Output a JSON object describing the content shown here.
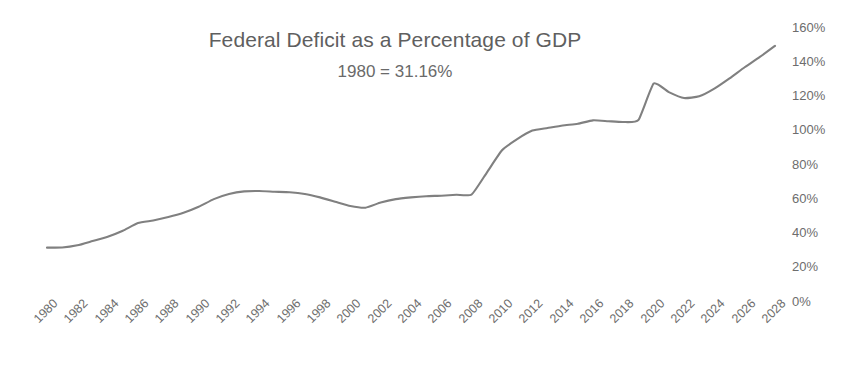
{
  "chart_data": {
    "type": "line",
    "title": "Federal Deficit as a Percentage of GDP",
    "subtitle": "1980 = 31.16%",
    "xlabel": "",
    "ylabel": "",
    "ylim": [
      0,
      160
    ],
    "xlim": [
      1980,
      2028
    ],
    "grid": false,
    "legend": null,
    "line_color": "#808080",
    "y_ticks": [
      "160%",
      "140%",
      "120%",
      "100%",
      "80%",
      "60%",
      "40%",
      "20%",
      "0%"
    ],
    "y_tick_values": [
      160,
      140,
      120,
      100,
      80,
      60,
      40,
      20,
      0
    ],
    "x_ticks": [
      "1980",
      "1982",
      "1984",
      "1986",
      "1988",
      "1990",
      "1992",
      "1994",
      "1996",
      "1998",
      "2000",
      "2002",
      "2004",
      "2006",
      "2008",
      "2010",
      "2012",
      "2014",
      "2016",
      "2018",
      "2020",
      "2022",
      "2024",
      "2026",
      "2028"
    ],
    "x_tick_values": [
      1980,
      1982,
      1984,
      1986,
      1988,
      1990,
      1992,
      1994,
      1996,
      1998,
      2000,
      2002,
      2004,
      2006,
      2008,
      2010,
      2012,
      2014,
      2016,
      2018,
      2020,
      2022,
      2024,
      2026,
      2028
    ],
    "x": [
      1980,
      1981,
      1982,
      1983,
      1984,
      1985,
      1986,
      1987,
      1988,
      1989,
      1990,
      1991,
      1992,
      1993,
      1994,
      1995,
      1996,
      1997,
      1998,
      1999,
      2000,
      2001,
      2002,
      2003,
      2004,
      2005,
      2006,
      2007,
      2008,
      2009,
      2010,
      2011,
      2012,
      2013,
      2014,
      2015,
      2016,
      2017,
      2018,
      2019,
      2020,
      2021,
      2022,
      2023,
      2024,
      2025,
      2026,
      2027,
      2028
    ],
    "values": [
      31.16,
      31.2,
      32.5,
      35.0,
      37.5,
      41.0,
      45.5,
      47.0,
      49.0,
      51.5,
      55.0,
      59.5,
      62.5,
      64.0,
      64.2,
      63.8,
      63.5,
      62.5,
      60.5,
      58.0,
      55.5,
      54.5,
      57.5,
      59.5,
      60.5,
      61.2,
      61.5,
      62.0,
      62.2,
      75.0,
      88.0,
      94.5,
      99.5,
      101.0,
      102.5,
      103.5,
      105.5,
      105.0,
      104.5,
      105.8,
      127.0,
      122.0,
      118.5,
      119.5,
      124.0,
      130.0,
      136.5,
      142.5,
      149.0
    ],
    "series_name": "Federal Debt as % of GDP"
  },
  "geometry": {
    "plot_left": 47,
    "plot_right": 775,
    "y_zero_px": 301,
    "px_per_percent": 1.7125
  }
}
